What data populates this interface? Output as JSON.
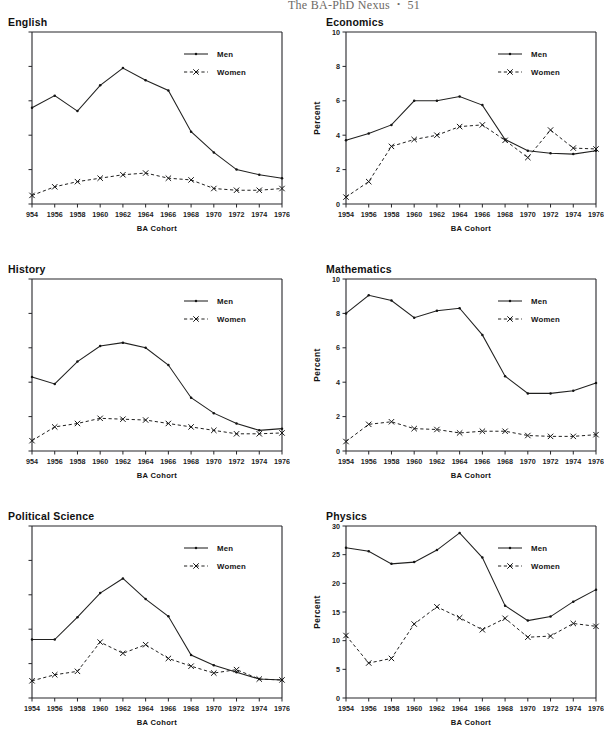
{
  "header": {
    "running_title": "The BA-PhD Nexus",
    "separator": "•",
    "page_number": "51"
  },
  "legend": {
    "men_label": "Men",
    "women_label": "Women"
  },
  "axis": {
    "x_title": "BA Cohort",
    "y_title": "Percent"
  },
  "panels": [
    {
      "id": "english",
      "title": "English",
      "y_labels_visible": false,
      "x_first_label_clipped": "954"
    },
    {
      "id": "economics",
      "title": "Economics",
      "y_labels_visible": true,
      "x_first_label_clipped": "1954"
    },
    {
      "id": "history",
      "title": "History",
      "y_labels_visible": false,
      "x_first_label_clipped": "954"
    },
    {
      "id": "mathematics",
      "title": "Mathematics",
      "y_labels_visible": true,
      "x_first_label_clipped": "1954"
    },
    {
      "id": "political-science",
      "title": "Political Science",
      "y_labels_visible": false,
      "x_first_label_clipped": "1954"
    },
    {
      "id": "physics",
      "title": "Physics",
      "y_labels_visible": true,
      "x_first_label_clipped": "1954"
    }
  ],
  "chart_data": [
    {
      "type": "line",
      "title": "English",
      "xlabel": "BA Cohort",
      "ylabel": "Percent",
      "x": [
        1954,
        1956,
        1958,
        1960,
        1962,
        1964,
        1966,
        1968,
        1970,
        1972,
        1974,
        1976
      ],
      "xtick_labels": [
        "954",
        "1956",
        "1958",
        "1960",
        "1962",
        "1964",
        "1966",
        "1968",
        "1970",
        "1972",
        "1974",
        "1976"
      ],
      "xlim": [
        1954,
        1976
      ],
      "ylim": [
        0,
        10
      ],
      "yticks": [
        0,
        2,
        4,
        6,
        8,
        10
      ],
      "ytick_labels_visible": false,
      "grid": false,
      "legend_position": "top-right",
      "series": [
        {
          "name": "Men",
          "style": "solid",
          "marker": "dot",
          "values": [
            5.6,
            6.3,
            5.4,
            6.9,
            7.9,
            7.2,
            6.6,
            4.2,
            3.0,
            2.0,
            1.7,
            1.5
          ]
        },
        {
          "name": "Women",
          "style": "dashed",
          "marker": "x",
          "values": [
            0.5,
            1.0,
            1.3,
            1.5,
            1.7,
            1.8,
            1.5,
            1.4,
            0.9,
            0.8,
            0.8,
            0.9
          ]
        }
      ]
    },
    {
      "type": "line",
      "title": "Economics",
      "xlabel": "BA Cohort",
      "ylabel": "Percent",
      "x": [
        1954,
        1956,
        1958,
        1960,
        1962,
        1964,
        1966,
        1968,
        1970,
        1972,
        1974,
        1976
      ],
      "xtick_labels": [
        "1954",
        "1956",
        "1958",
        "1960",
        "1962",
        "1964",
        "1966",
        "1968",
        "1970",
        "1972",
        "1974",
        "1976"
      ],
      "xlim": [
        1954,
        1976
      ],
      "ylim": [
        0,
        10
      ],
      "yticks": [
        0,
        2,
        4,
        6,
        8,
        10
      ],
      "ytick_labels_visible": true,
      "grid": false,
      "legend_position": "top-right",
      "series": [
        {
          "name": "Men",
          "style": "solid",
          "marker": "dot",
          "values": [
            3.7,
            4.1,
            4.6,
            6.0,
            6.0,
            6.25,
            5.75,
            3.75,
            3.1,
            2.95,
            2.9,
            3.1
          ]
        },
        {
          "name": "Women",
          "style": "dashed",
          "marker": "x",
          "values": [
            0.4,
            1.3,
            3.35,
            3.75,
            4.0,
            4.5,
            4.6,
            3.7,
            2.7,
            4.3,
            3.25,
            3.2
          ]
        }
      ]
    },
    {
      "type": "line",
      "title": "History",
      "xlabel": "BA Cohort",
      "ylabel": "Percent",
      "x": [
        1954,
        1956,
        1958,
        1960,
        1962,
        1964,
        1966,
        1968,
        1970,
        1972,
        1974,
        1976
      ],
      "xtick_labels": [
        "954",
        "1956",
        "1958",
        "1960",
        "1962",
        "1964",
        "1966",
        "1968",
        "1970",
        "1972",
        "1974",
        "1976"
      ],
      "xlim": [
        1954,
        1976
      ],
      "ylim": [
        0,
        10
      ],
      "yticks": [
        0,
        2,
        4,
        6,
        8,
        10
      ],
      "ytick_labels_visible": false,
      "grid": false,
      "legend_position": "top-right",
      "series": [
        {
          "name": "Men",
          "style": "solid",
          "marker": "dot",
          "values": [
            4.3,
            3.9,
            5.2,
            6.1,
            6.3,
            6.0,
            5.0,
            3.1,
            2.2,
            1.6,
            1.2,
            1.3
          ]
        },
        {
          "name": "Women",
          "style": "dashed",
          "marker": "x",
          "values": [
            0.6,
            1.4,
            1.6,
            1.9,
            1.85,
            1.8,
            1.6,
            1.4,
            1.2,
            1.0,
            1.0,
            1.05
          ]
        }
      ]
    },
    {
      "type": "line",
      "title": "Mathematics",
      "xlabel": "BA Cohort",
      "ylabel": "Percent",
      "x": [
        1954,
        1956,
        1958,
        1960,
        1962,
        1964,
        1966,
        1968,
        1970,
        1972,
        1974,
        1976
      ],
      "xtick_labels": [
        "1954",
        "1956",
        "1958",
        "1960",
        "1962",
        "1964",
        "1966",
        "1968",
        "1970",
        "1972",
        "1974",
        "1976"
      ],
      "xlim": [
        1954,
        1976
      ],
      "ylim": [
        0,
        10
      ],
      "yticks": [
        0,
        2,
        4,
        6,
        8,
        10
      ],
      "ytick_labels_visible": true,
      "grid": false,
      "legend_position": "top-right",
      "series": [
        {
          "name": "Men",
          "style": "solid",
          "marker": "dot",
          "values": [
            8.0,
            9.05,
            8.75,
            7.75,
            8.15,
            8.3,
            6.75,
            4.35,
            3.35,
            3.35,
            3.5,
            3.95
          ]
        },
        {
          "name": "Women",
          "style": "dashed",
          "marker": "x",
          "values": [
            0.55,
            1.55,
            1.7,
            1.3,
            1.25,
            1.05,
            1.15,
            1.15,
            0.9,
            0.85,
            0.85,
            0.95
          ]
        }
      ]
    },
    {
      "type": "line",
      "title": "Political Science",
      "xlabel": "BA Cohort",
      "ylabel": "Percent",
      "x": [
        1954,
        1956,
        1958,
        1960,
        1962,
        1964,
        1966,
        1968,
        1970,
        1972,
        1974,
        1976
      ],
      "xtick_labels": [
        "1954",
        "1956",
        "1958",
        "1960",
        "1962",
        "1964",
        "1966",
        "1968",
        "1970",
        "1972",
        "1974",
        "1976"
      ],
      "xlim": [
        1954,
        1976
      ],
      "ylim": [
        0,
        10
      ],
      "yticks": [
        0,
        2,
        4,
        6,
        8,
        10
      ],
      "ytick_labels_visible": false,
      "grid": false,
      "legend_position": "top-right",
      "series": [
        {
          "name": "Men",
          "style": "solid",
          "marker": "dot",
          "values": [
            3.4,
            3.4,
            4.7,
            6.1,
            6.95,
            5.75,
            4.75,
            2.5,
            1.9,
            1.5,
            1.1,
            1.05
          ]
        },
        {
          "name": "Women",
          "style": "dashed",
          "marker": "x",
          "values": [
            1.0,
            1.35,
            1.55,
            3.25,
            2.6,
            3.1,
            2.3,
            1.85,
            1.45,
            1.65,
            1.1,
            1.05
          ]
        }
      ]
    },
    {
      "type": "line",
      "title": "Physics",
      "xlabel": "BA Cohort",
      "ylabel": "Percent",
      "x": [
        1954,
        1956,
        1958,
        1960,
        1962,
        1964,
        1966,
        1968,
        1970,
        1972,
        1974,
        1976
      ],
      "xtick_labels": [
        "1954",
        "1956",
        "1958",
        "1960",
        "1962",
        "1964",
        "1966",
        "1968",
        "1970",
        "1972",
        "1974",
        "1976"
      ],
      "xlim": [
        0,
        30
      ],
      "ylim": [
        0,
        30
      ],
      "yticks": [
        0,
        5,
        10,
        15,
        20,
        25,
        30
      ],
      "ytick_labels_visible": true,
      "grid": false,
      "legend_position": "top-right",
      "series": [
        {
          "name": "Men",
          "style": "solid",
          "marker": "dot",
          "values": [
            26.2,
            25.6,
            23.4,
            23.7,
            25.8,
            28.8,
            24.5,
            16.1,
            13.5,
            14.2,
            16.8,
            18.9
          ]
        },
        {
          "name": "Women",
          "style": "dashed",
          "marker": "x",
          "values": [
            10.9,
            6.1,
            6.9,
            12.9,
            15.9,
            14.0,
            11.9,
            13.9,
            10.6,
            10.8,
            13.0,
            12.5
          ]
        }
      ]
    }
  ]
}
